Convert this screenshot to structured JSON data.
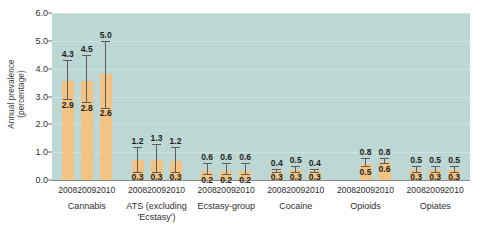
{
  "chart_data": {
    "type": "bar",
    "title": "",
    "subtitle": "",
    "xlabel": "",
    "ylabel": "Annual prevalence\n(percentage)",
    "ylim": [
      0.0,
      6.0
    ],
    "ytick_step": 1.0,
    "yticks": [
      "0.0",
      "1.0",
      "2.0",
      "3.0",
      "4.0",
      "5.0",
      "6.0"
    ],
    "ytick_values": [
      0.0,
      1.0,
      2.0,
      3.0,
      4.0,
      5.0,
      6.0
    ],
    "grid": true,
    "legend": "none",
    "plot_background": "#bdd8d4",
    "bar_color": "#f2c383",
    "error_bar_color": "#5b5b5b",
    "categories": [
      "2008",
      "2009",
      "2010"
    ],
    "groups": [
      {
        "name": "Cannabis",
        "points": [
          {
            "year": "2008",
            "lower": 2.9,
            "upper": 4.3,
            "bar_top": 3.55
          },
          {
            "year": "2009",
            "lower": 2.8,
            "upper": 4.5,
            "bar_top": 3.55
          },
          {
            "year": "2010",
            "lower": 2.6,
            "upper": 5.0,
            "bar_top": 3.8
          }
        ]
      },
      {
        "name": "ATS (excluding\n'Ecstasy')",
        "points": [
          {
            "year": "2008",
            "lower": 0.3,
            "upper": 1.2,
            "bar_top": 0.72
          },
          {
            "year": "2009",
            "lower": 0.3,
            "upper": 1.3,
            "bar_top": 0.72
          },
          {
            "year": "2010",
            "lower": 0.3,
            "upper": 1.2,
            "bar_top": 0.7
          }
        ]
      },
      {
        "name": "Ecstasy-group",
        "points": [
          {
            "year": "2008",
            "lower": 0.2,
            "upper": 0.6,
            "bar_top": 0.33
          },
          {
            "year": "2009",
            "lower": 0.2,
            "upper": 0.6,
            "bar_top": 0.33
          },
          {
            "year": "2010",
            "lower": 0.2,
            "upper": 0.6,
            "bar_top": 0.33
          }
        ]
      },
      {
        "name": "Cocaine",
        "points": [
          {
            "year": "2008",
            "lower": 0.3,
            "upper": 0.4,
            "bar_top": 0.33
          },
          {
            "year": "2009",
            "lower": 0.3,
            "upper": 0.5,
            "bar_top": 0.35
          },
          {
            "year": "2010",
            "lower": 0.3,
            "upper": 0.4,
            "bar_top": 0.33
          }
        ]
      },
      {
        "name": "Opioids",
        "points": [
          {
            "year": "2008",
            "lower": null,
            "upper": null,
            "bar_top": null
          },
          {
            "year": "2009",
            "lower": 0.5,
            "upper": 0.8,
            "bar_top": 0.58
          },
          {
            "year": "2010",
            "lower": 0.6,
            "upper": 0.8,
            "bar_top": 0.66
          }
        ]
      },
      {
        "name": "Opiates",
        "points": [
          {
            "year": "2008",
            "lower": 0.3,
            "upper": 0.5,
            "bar_top": 0.36
          },
          {
            "year": "2009",
            "lower": 0.3,
            "upper": 0.5,
            "bar_top": 0.36
          },
          {
            "year": "2010",
            "lower": 0.3,
            "upper": 0.5,
            "bar_top": 0.36
          }
        ]
      }
    ]
  }
}
